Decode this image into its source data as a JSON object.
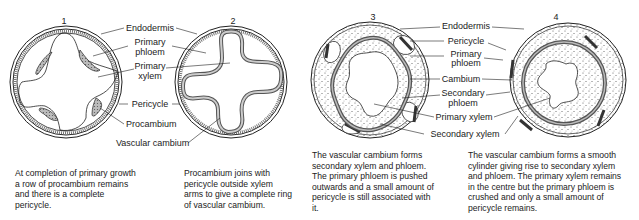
{
  "panels": [
    {
      "number": "1",
      "caption": "At completion of primary growth a row of procambium remains and there is a complete pericycle."
    },
    {
      "number": "2",
      "caption": "Procambium joins with pericycle outside xylem arms to give a complete ring of vascular cambium."
    },
    {
      "number": "3",
      "caption": "The vascular cambium forms secondary xylem and phloem. The primary phloem is pushed outwards and a small amount of pericycle is still associated with it."
    },
    {
      "number": "4",
      "caption": "The vascular cambium forms a smooth cylinder giving rise to secondary xylem and phloem. The primary xylem remains in the centre but the primary phloem is crushed and only a small amount of pericycle remains."
    }
  ],
  "labels_left": {
    "endodermis": "Endodermis",
    "primary_phloem_1": "Primary",
    "primary_phloem_2": "phloem",
    "primary_xylem_1": "Primary",
    "primary_xylem_2": "xylem",
    "pericycle": "Pericycle",
    "procambium": "Procambium",
    "vascular_cambium": "Vascular cambium"
  },
  "labels_right": {
    "endodermis": "Endodermis",
    "pericycle": "Pericycle",
    "primary_phloem_1": "Primary",
    "primary_phloem_2": "phloem",
    "cambium": "Cambium",
    "secondary_phloem_1": "Secondary",
    "secondary_phloem_2": "phloem",
    "primary_xylem": "Primary xylem",
    "secondary_xylem": "Secondary xylem"
  }
}
